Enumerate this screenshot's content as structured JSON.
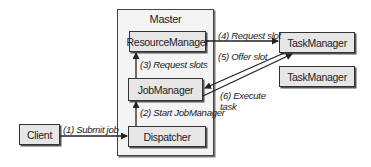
{
  "diagram": {
    "master": {
      "title": "Master"
    },
    "nodes": {
      "resource_manager": "ResourceManager",
      "job_manager": "JobManager",
      "dispatcher": "Dispatcher",
      "client": "Client",
      "task_manager_1": "TaskManager",
      "task_manager_2": "TaskManager"
    },
    "edges": [
      {
        "from": "Client",
        "to": "Dispatcher",
        "label": "(1) Submit job"
      },
      {
        "from": "Dispatcher",
        "to": "JobManager",
        "label": "(2) Start JobManager"
      },
      {
        "from": "JobManager",
        "to": "ResourceManager",
        "label": "(3) Request slots"
      },
      {
        "from": "ResourceManager",
        "to": "TaskManager",
        "label": "(4) Request slot"
      },
      {
        "from": "TaskManager",
        "to": "JobManager",
        "label": "(5) Offer slot"
      },
      {
        "from": "JobManager",
        "to": "TaskManager",
        "label_line1": "(6) Execute",
        "label_line2": "task"
      }
    ],
    "colors": {
      "box_fill": "#e6e6e6",
      "master_fill": "#f4f4f4",
      "stroke": "#333333"
    }
  }
}
